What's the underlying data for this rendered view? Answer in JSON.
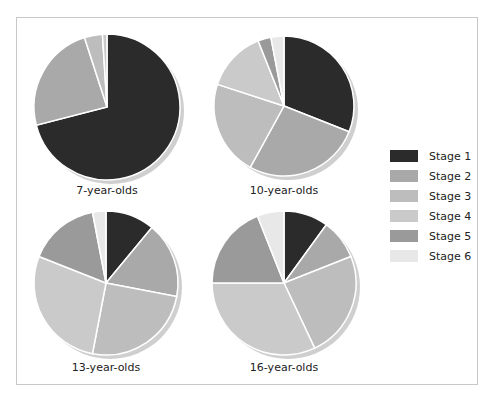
{
  "chart_data": {
    "type": "pie",
    "title": "",
    "legend_position": "right",
    "legend": [
      "Stage 1",
      "Stage 2",
      "Stage 3",
      "Stage 4",
      "Stage 5",
      "Stage 6"
    ],
    "colors": [
      "#2b2b2b",
      "#a9a9a9",
      "#bdbdbd",
      "#cacaca",
      "#9a9a9a",
      "#e8e8e8"
    ],
    "charts": [
      {
        "label": "7-year-olds",
        "values": [
          71,
          24,
          4,
          1,
          0,
          0
        ]
      },
      {
        "label": "10-year-olds",
        "values": [
          31,
          27,
          22,
          14,
          3,
          3
        ]
      },
      {
        "label": "13-year-olds",
        "values": [
          11,
          17,
          25,
          28,
          16,
          3
        ]
      },
      {
        "label": "16-year-olds",
        "values": [
          10,
          9,
          24,
          32,
          19,
          6
        ]
      }
    ]
  },
  "legend": {
    "items": [
      {
        "label": "Stage 1",
        "color": "#2b2b2b"
      },
      {
        "label": "Stage 2",
        "color": "#a9a9a9"
      },
      {
        "label": "Stage 3",
        "color": "#bdbdbd"
      },
      {
        "label": "Stage 4",
        "color": "#cacaca"
      },
      {
        "label": "Stage 5",
        "color": "#9a9a9a"
      },
      {
        "label": "Stage 6",
        "color": "#e8e8e8"
      }
    ]
  }
}
